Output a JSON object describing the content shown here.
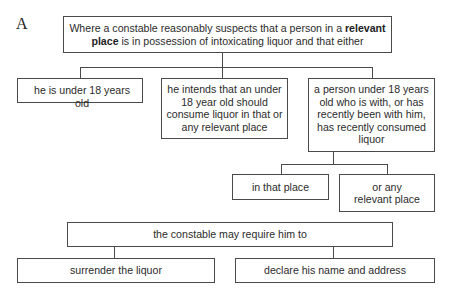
{
  "figure_label": "A",
  "root": {
    "text_before": "Where a constable reasonably suspects that a person in a ",
    "bold": "relevant place",
    "text_after": " is in possession of intoxicating liquor and that either"
  },
  "conditions": [
    {
      "text": "he is under 18 years old"
    },
    {
      "text": "he intends that an under 18 year old should consume liquor in that or any relevant place"
    },
    {
      "text": "a person under 18 years old who is with, or has recently been with him, has recently consumed liquor"
    }
  ],
  "sub_conditions": [
    {
      "text": "in that place"
    },
    {
      "text": "or any relevant place"
    }
  ],
  "consequence": {
    "text": "the constable may require him to"
  },
  "actions": [
    {
      "text": "surrender the liquor"
    },
    {
      "text": "declare his name and address"
    }
  ]
}
